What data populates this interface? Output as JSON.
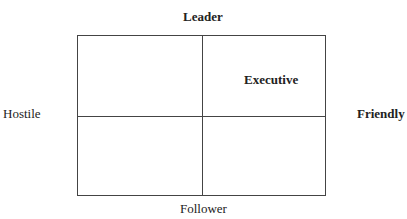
{
  "diagram": {
    "axes": {
      "top": "Leader",
      "bottom": "Follower",
      "left": "Hostile",
      "right": "Friendly"
    },
    "quadrants": {
      "top_left": "",
      "top_right": "Executive",
      "bottom_left": "",
      "bottom_right": ""
    }
  }
}
